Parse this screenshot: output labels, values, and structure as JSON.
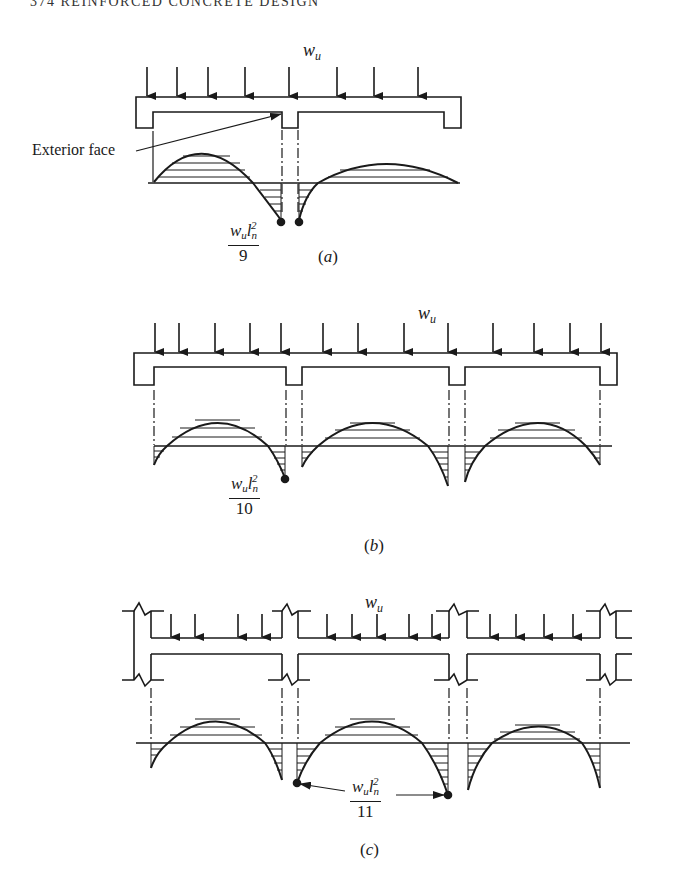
{
  "page": {
    "header": "374   REINFORCED   CONCRETE   DESIGN"
  },
  "figures": [
    {
      "id": "a",
      "caption_letter": "a",
      "load_label": "w",
      "load_subscript": "u",
      "spans": 2,
      "annotation": "Exterior face",
      "moment": {
        "num_w": "w",
        "num_w_sub": "u",
        "num_l": "l",
        "num_l_sub": "n",
        "num_l_sup": "2",
        "denominator": "9"
      }
    },
    {
      "id": "b",
      "caption_letter": "b",
      "load_label": "w",
      "load_subscript": "u",
      "spans": 3,
      "moment": {
        "num_w": "w",
        "num_w_sub": "u",
        "num_l": "l",
        "num_l_sub": "n",
        "num_l_sup": "2",
        "denominator": "10"
      }
    },
    {
      "id": "c",
      "caption_letter": "c",
      "load_label": "w",
      "load_subscript": "u",
      "spans": 3,
      "moment": {
        "num_w": "w",
        "num_w_sub": "u",
        "num_l": "l",
        "num_l_sub": "n",
        "num_l_sup": "2",
        "denominator": "11"
      }
    }
  ],
  "colors": {
    "ink": "#1a1a1a",
    "paper": "#ffffff"
  }
}
